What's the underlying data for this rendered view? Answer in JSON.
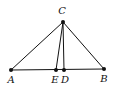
{
  "diagram": {
    "type": "triangle",
    "points": [
      {
        "id": "A",
        "label": "A"
      },
      {
        "id": "B",
        "label": "B"
      },
      {
        "id": "C",
        "label": "C"
      },
      {
        "id": "D",
        "label": "D"
      },
      {
        "id": "E",
        "label": "E"
      }
    ],
    "segments": [
      {
        "from": "A",
        "to": "B"
      },
      {
        "from": "A",
        "to": "C"
      },
      {
        "from": "B",
        "to": "C"
      },
      {
        "from": "C",
        "to": "E"
      },
      {
        "from": "C",
        "to": "D"
      }
    ],
    "colors": {
      "ink": "#111111",
      "background": "#ffffff"
    }
  }
}
